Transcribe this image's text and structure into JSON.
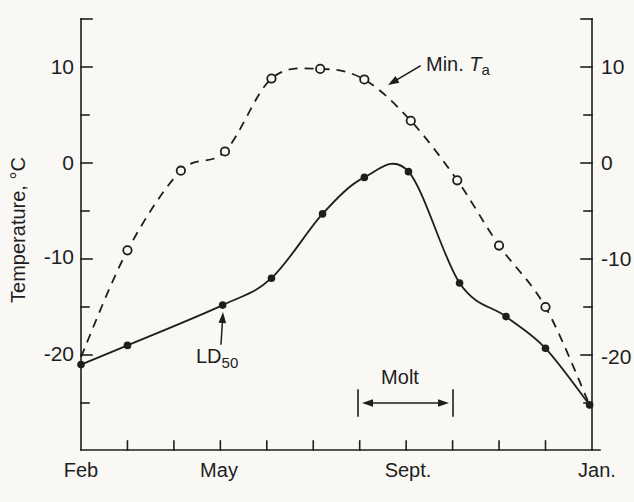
{
  "colors": {
    "paper": "#f9f8f4",
    "ink": "#1e1e1e"
  },
  "ylabel": "Temperature, °C",
  "axes": {
    "y_tick_labels": [
      "10",
      "0",
      "-10",
      "-20"
    ],
    "x_tick_labels": [
      "Feb",
      "May",
      "Sept.",
      "Jan."
    ]
  },
  "annotations": {
    "min_ta": {
      "prefix": "Min. ",
      "symbol": "T",
      "subscript": "a"
    },
    "ld50": {
      "prefix": "LD",
      "subscript": "50"
    },
    "molt": {
      "label": "Molt"
    }
  },
  "chart_data": {
    "type": "line",
    "title": "",
    "xlabel": "",
    "ylabel": "Temperature, °C",
    "x_unit": "month",
    "x_categories": [
      "Feb",
      "Mar",
      "Apr",
      "May",
      "Jun",
      "Jul",
      "Aug",
      "Sep",
      "Oct",
      "Nov",
      "Dec",
      "Jan"
    ],
    "x_labeled_ticks": [
      "Feb",
      "May",
      "Sept.",
      "Jan."
    ],
    "x_labeled_tick_positions": [
      0,
      3,
      7,
      11
    ],
    "ylim": [
      -30,
      15
    ],
    "y_ticks_labeled": [
      10,
      0,
      -10,
      -20
    ],
    "y_ticks_unlabeled": [
      15,
      5,
      -5,
      -15,
      -25
    ],
    "grid": false,
    "legend_position": "inline-annotations",
    "series": [
      {
        "name": "Min. Ta",
        "line": "dashed",
        "marker": "open-circle",
        "points": [
          {
            "x": 0,
            "y": -20.2,
            "marker": false
          },
          {
            "x": 1,
            "y": -9.1
          },
          {
            "x": 2.15,
            "y": -0.8
          },
          {
            "x": 3.1,
            "y": 1.2
          },
          {
            "x": 4.1,
            "y": 8.8
          },
          {
            "x": 5.15,
            "y": 9.8
          },
          {
            "x": 6.1,
            "y": 8.7
          },
          {
            "x": 7.1,
            "y": 4.4
          },
          {
            "x": 8.1,
            "y": -1.8
          },
          {
            "x": 9,
            "y": -8.6
          },
          {
            "x": 10,
            "y": -15.0
          },
          {
            "x": 10.95,
            "y": -25.2,
            "marker": false
          }
        ]
      },
      {
        "name": "LD50",
        "line": "solid",
        "marker": "filled-circle",
        "points": [
          {
            "x": 0,
            "y": -21.0
          },
          {
            "x": 1,
            "y": -19.0
          },
          {
            "x": 3.05,
            "y": -14.8
          },
          {
            "x": 4.1,
            "y": -12.0
          },
          {
            "x": 5.2,
            "y": -5.3
          },
          {
            "x": 6.1,
            "y": -1.5
          },
          {
            "x": 7.05,
            "y": -0.9
          },
          {
            "x": 8.15,
            "y": -12.5
          },
          {
            "x": 9.15,
            "y": -16.0
          },
          {
            "x": 10,
            "y": -19.3
          },
          {
            "x": 10.95,
            "y": -25.2
          }
        ]
      }
    ],
    "annotation_geometry": {
      "min_ta_arrow": {
        "from": [
          420,
          66
        ],
        "to": [
          388,
          85
        ]
      },
      "ld50_arrow": {
        "from": [
          221,
          344
        ],
        "to": [
          223,
          312
        ]
      },
      "molt_span": {
        "x1": 358,
        "x2": 453,
        "bar_top": 390,
        "bar_bottom": 416,
        "arrow_y": 403,
        "months": [
          "Aug",
          "Oct"
        ]
      }
    }
  }
}
